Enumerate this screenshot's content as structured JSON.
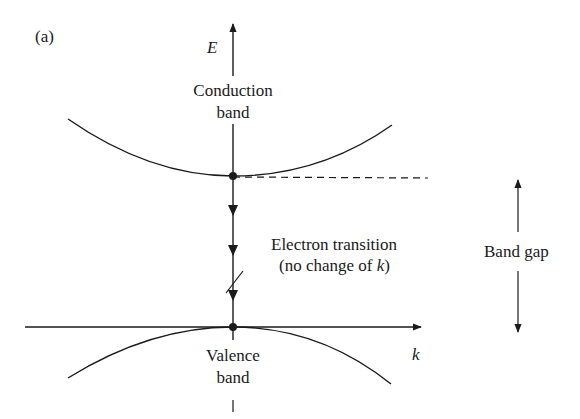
{
  "figure": {
    "panel_label": "(a)",
    "axes": {
      "vertical_label": "E",
      "horizontal_label": "k"
    },
    "conduction_band": {
      "line1": "Conduction",
      "line2": "band"
    },
    "valence_band": {
      "line1": "Valence",
      "line2": "band"
    },
    "transition": {
      "line1": "Electron transition",
      "line2_prefix": "(no change of ",
      "line2_var": "k",
      "line2_suffix": ")"
    },
    "band_gap": {
      "label": "Band gap"
    }
  },
  "colors": {
    "ink": "#1a1a1a",
    "background": "#ffffff"
  }
}
